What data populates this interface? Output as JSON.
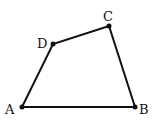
{
  "diagram": {
    "type": "quadrilateral",
    "points": [
      {
        "label": "A",
        "x": 22,
        "y": 107,
        "lx": 5,
        "ly": 114
      },
      {
        "label": "B",
        "x": 135,
        "y": 107,
        "lx": 139,
        "ly": 114
      },
      {
        "label": "C",
        "x": 109,
        "y": 26,
        "lx": 103,
        "ly": 21
      },
      {
        "label": "D",
        "x": 53,
        "y": 44,
        "lx": 37,
        "ly": 48
      }
    ],
    "edges": [
      [
        "A",
        "B"
      ],
      [
        "B",
        "C"
      ],
      [
        "C",
        "D"
      ],
      [
        "D",
        "A"
      ]
    ],
    "stroke_color": "#111111"
  }
}
